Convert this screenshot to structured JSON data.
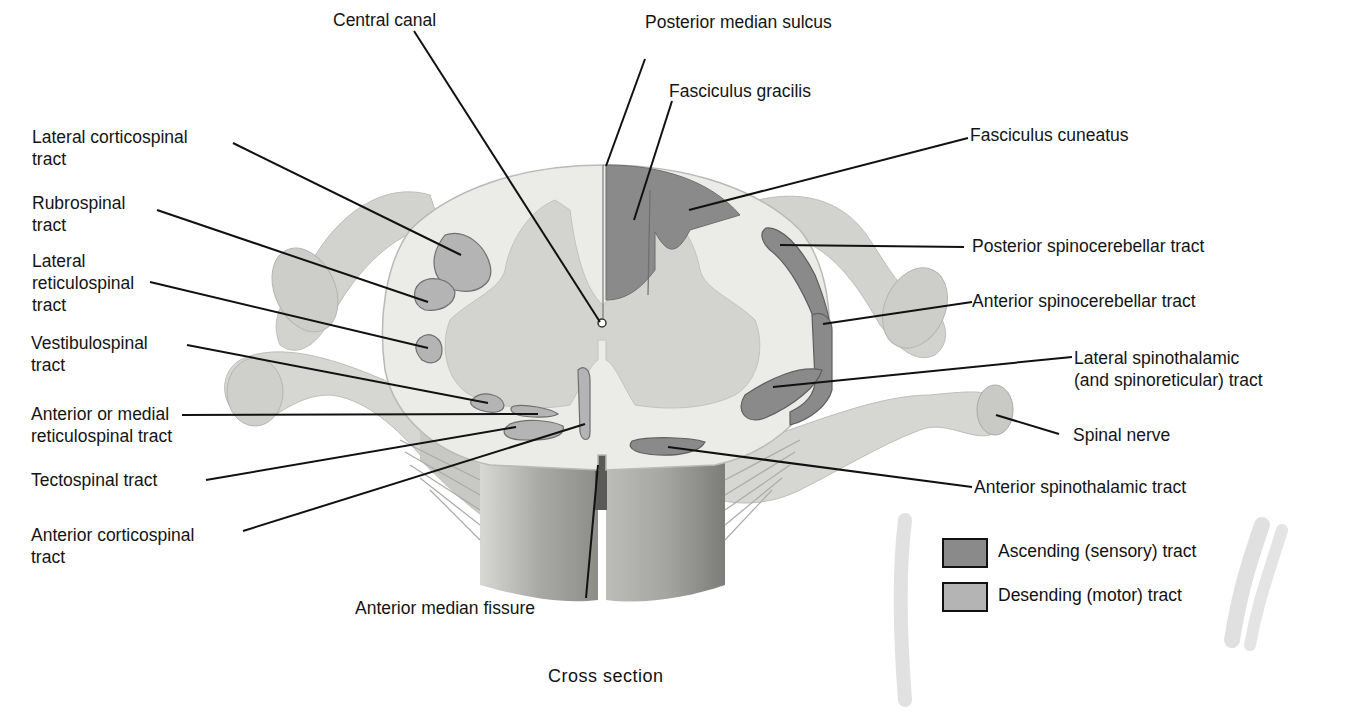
{
  "diagram": {
    "caption": "Cross section",
    "colors": {
      "ascending": "#8a8a8a",
      "descending": "#b4b4b4",
      "white_matter": "#e9e9e6",
      "gray_matter": "#cfcfcc",
      "nerve": "#cdcdca",
      "leader_line": "#111111"
    },
    "labels_left": [
      {
        "id": "lateral-corticospinal-tract",
        "line1": "Lateral corticospinal",
        "line2": "tract",
        "type": "descending"
      },
      {
        "id": "rubrospinal-tract",
        "line1": "Rubrospinal",
        "line2": "tract",
        "type": "descending"
      },
      {
        "id": "lateral-reticulospinal-tract",
        "line1": "Lateral",
        "line2": "reticulospinal",
        "line3": "tract",
        "type": "descending"
      },
      {
        "id": "vestibulospinal-tract",
        "line1": "Vestibulospinal",
        "line2": "tract",
        "type": "descending"
      },
      {
        "id": "anterior-medial-reticulospinal-tract",
        "line1": "Anterior or medial",
        "line2": "reticulospinal tract",
        "type": "descending"
      },
      {
        "id": "tectospinal-tract",
        "line1": "Tectospinal tract",
        "type": "descending"
      },
      {
        "id": "anterior-corticospinal-tract",
        "line1": "Anterior corticospinal",
        "line2": "tract",
        "type": "descending"
      }
    ],
    "labels_top": [
      {
        "id": "central-canal",
        "line1": "Central canal"
      },
      {
        "id": "posterior-median-sulcus",
        "line1": "Posterior median sulcus"
      },
      {
        "id": "fasciculus-gracilis",
        "line1": "Fasciculus gracilis",
        "type": "ascending"
      }
    ],
    "labels_right": [
      {
        "id": "fasciculus-cuneatus",
        "line1": "Fasciculus cuneatus",
        "type": "ascending"
      },
      {
        "id": "posterior-spinocerebellar-tract",
        "line1": "Posterior spinocerebellar tract",
        "type": "ascending"
      },
      {
        "id": "anterior-spinocerebellar-tract",
        "line1": "Anterior spinocerebellar tract",
        "type": "ascending"
      },
      {
        "id": "lateral-spinothalamic-tract",
        "line1": "Lateral spinothalamic",
        "line2": "(and spinoreticular)",
        "line2b": "tract",
        "type": "ascending"
      },
      {
        "id": "spinal-nerve",
        "line1": "Spinal nerve"
      },
      {
        "id": "anterior-spinothalamic-tract",
        "line1": "Anterior spinothalamic tract",
        "type": "ascending"
      }
    ],
    "labels_bottom": [
      {
        "id": "anterior-median-fissure",
        "line1": "Anterior median fissure"
      }
    ],
    "legend": [
      {
        "label": "Ascending (sensory) tract",
        "color": "#8a8a8a"
      },
      {
        "label": "Desending (motor) tract",
        "color": "#b4b4b4"
      }
    ]
  }
}
